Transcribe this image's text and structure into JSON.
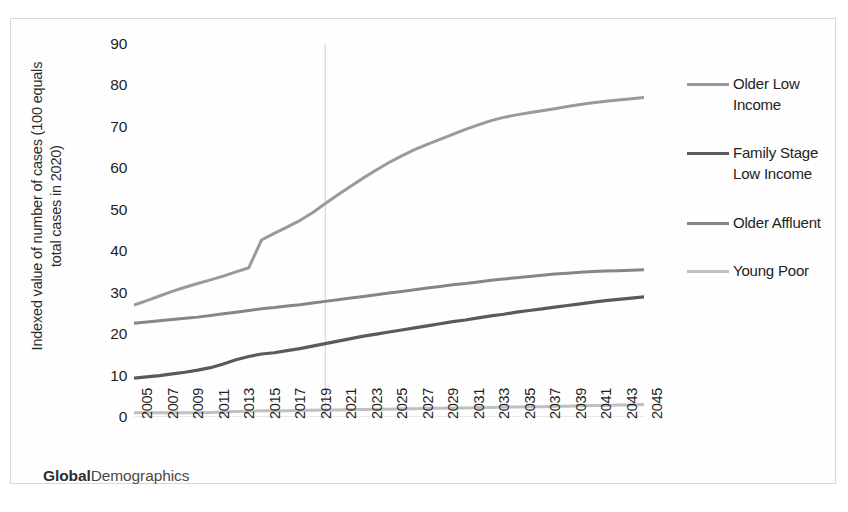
{
  "chart_data": {
    "type": "line",
    "title": "",
    "xlabel": "",
    "ylabel": "Indexed value of number of cases  (100 equals\ntotal cases in 2020)",
    "ylim": [
      0,
      90
    ],
    "ytick_values": [
      90,
      80,
      70,
      60,
      50,
      40,
      30,
      20,
      10,
      0
    ],
    "ytick_labels": [
      "90",
      "80",
      "70",
      "60",
      "50",
      "40",
      "30",
      "20",
      "10",
      "0"
    ],
    "xlim": [
      2005,
      2045
    ],
    "categories": [
      2005,
      2006,
      2007,
      2008,
      2009,
      2010,
      2011,
      2012,
      2013,
      2014,
      2015,
      2016,
      2017,
      2018,
      2019,
      2020,
      2021,
      2022,
      2023,
      2024,
      2025,
      2026,
      2027,
      2028,
      2029,
      2030,
      2031,
      2032,
      2033,
      2034,
      2035,
      2036,
      2037,
      2038,
      2039,
      2040,
      2041,
      2042,
      2043,
      2044,
      2045
    ],
    "xtick_labels": [
      "2005",
      "2007",
      "2009",
      "2011",
      "2013",
      "2015",
      "2017",
      "2019",
      "2021",
      "2023",
      "2025",
      "2027",
      "2029",
      "2031",
      "2033",
      "2035",
      "2037",
      "2039",
      "2041",
      "2043",
      "2045"
    ],
    "grid": "vertical-single-at-2020",
    "gridline_x": 2020,
    "legend_position": "right",
    "series": [
      {
        "name": "Older Low Income",
        "color": "#9a9a9a",
        "width": 3.0,
        "values": [
          27.0,
          28.1,
          29.2,
          30.3,
          31.3,
          32.2,
          33.1,
          34.0,
          35.0,
          36.0,
          42.7,
          44.3,
          45.8,
          47.4,
          49.3,
          51.5,
          53.6,
          55.7,
          57.7,
          59.6,
          61.4,
          63.0,
          64.5,
          65.8,
          67.0,
          68.2,
          69.4,
          70.5,
          71.5,
          72.3,
          72.9,
          73.4,
          73.9,
          74.4,
          74.9,
          75.4,
          75.8,
          76.2,
          76.5,
          76.8,
          77.1
        ]
      },
      {
        "name": "Family Stage Low Income",
        "color": "#5a5a5a",
        "width": 3.2,
        "values": [
          9.4,
          9.7,
          10.0,
          10.4,
          10.8,
          11.3,
          11.9,
          12.8,
          13.8,
          14.6,
          15.2,
          15.5,
          16.0,
          16.5,
          17.1,
          17.7,
          18.3,
          18.9,
          19.5,
          20.0,
          20.5,
          21.0,
          21.5,
          22.0,
          22.5,
          23.0,
          23.4,
          23.9,
          24.4,
          24.8,
          25.3,
          25.7,
          26.1,
          26.5,
          26.9,
          27.3,
          27.7,
          28.1,
          28.4,
          28.7,
          29.0
        ]
      },
      {
        "name": "Older Affluent",
        "color": "#868686",
        "width": 3.0,
        "values": [
          22.6,
          22.9,
          23.2,
          23.5,
          23.8,
          24.1,
          24.5,
          24.9,
          25.3,
          25.7,
          26.1,
          26.4,
          26.8,
          27.1,
          27.5,
          27.9,
          28.3,
          28.7,
          29.1,
          29.5,
          29.9,
          30.3,
          30.7,
          31.1,
          31.5,
          31.9,
          32.2,
          32.6,
          33.0,
          33.3,
          33.6,
          33.9,
          34.2,
          34.5,
          34.7,
          34.9,
          35.1,
          35.2,
          35.3,
          35.4,
          35.5
        ]
      },
      {
        "name": "Young Poor",
        "color": "#c0c0c0",
        "width": 3.0,
        "values": [
          1.0,
          1.0,
          1.0,
          1.0,
          1.0,
          1.0,
          1.1,
          1.2,
          1.3,
          1.4,
          1.5,
          1.5,
          1.5,
          1.6,
          1.6,
          1.7,
          1.7,
          1.8,
          1.8,
          1.9,
          1.9,
          2.0,
          2.0,
          2.1,
          2.1,
          2.2,
          2.2,
          2.3,
          2.3,
          2.4,
          2.4,
          2.5,
          2.5,
          2.6,
          2.6,
          2.7,
          2.8,
          2.8,
          2.9,
          2.9,
          3.0
        ]
      }
    ]
  },
  "legend": {
    "items": [
      {
        "label": "Older Low Income",
        "color": "#9a9a9a"
      },
      {
        "label": "Family Stage Low Income",
        "color": "#5a5a5a"
      },
      {
        "label": "Older Affluent",
        "color": "#868686"
      },
      {
        "label": "Young Poor",
        "color": "#c0c0c0"
      }
    ]
  },
  "brand": {
    "strong": "Global",
    "rest": "Demographics"
  }
}
